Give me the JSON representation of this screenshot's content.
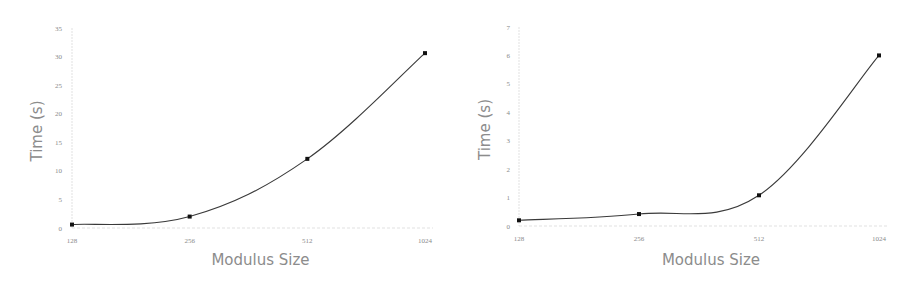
{
  "chart_data": [
    {
      "type": "line",
      "title": "",
      "xlabel": "Modulus Size",
      "ylabel": "Time (s)",
      "categories": [
        "128",
        "256",
        "512",
        "1024"
      ],
      "values": [
        0.6,
        2.0,
        12.1,
        30.6
      ],
      "yticks": [
        "0",
        "5",
        "10",
        "15",
        "20",
        "25",
        "30",
        "35"
      ],
      "ylim": [
        0,
        35
      ],
      "grid": false,
      "smooth": true,
      "markers": true,
      "legend": null
    },
    {
      "type": "line",
      "title": "",
      "xlabel": "Modulus Size",
      "ylabel": "Time (s)",
      "categories": [
        "128",
        "256",
        "512",
        "1024"
      ],
      "values": [
        0.2,
        0.42,
        1.08,
        6.0
      ],
      "yticks": [
        "0",
        "1",
        "2",
        "3",
        "4",
        "5",
        "6",
        "7"
      ],
      "ylim": [
        0,
        7
      ],
      "grid": false,
      "smooth": true,
      "markers": true,
      "legend": null
    }
  ],
  "colors": {
    "line": "#3a3a3a",
    "marker": "#111111",
    "axis_text": "#8a8a8a",
    "axis_line": "#d9d9d9"
  }
}
